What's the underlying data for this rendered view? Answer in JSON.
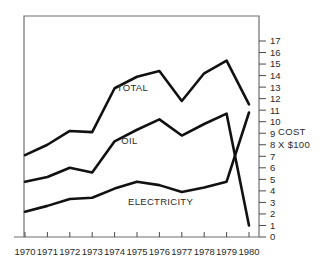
{
  "chart_data": {
    "type": "line",
    "title": "",
    "xlabel": "",
    "ylabel": "COST X $100",
    "ylim": [
      0,
      17
    ],
    "xlim": [
      1970,
      1980
    ],
    "grid": false,
    "legend_position": "inline-annotations",
    "categories": [
      "1970",
      "1971",
      "1972",
      "1973",
      "1974",
      "1975",
      "1976",
      "1977",
      "1978",
      "1979",
      "1980"
    ],
    "yticks": [
      "0",
      "1",
      "2",
      "3",
      "4",
      "5",
      "6",
      "7",
      "8",
      "9",
      "10",
      "11",
      "12",
      "13",
      "14",
      "15",
      "16",
      "17"
    ],
    "series": [
      {
        "name": "TOTAL",
        "values": [
          7.1,
          8.0,
          9.2,
          9.1,
          12.9,
          13.9,
          14.4,
          11.8,
          14.2,
          15.3,
          11.5
        ]
      },
      {
        "name": "OIL",
        "values": [
          4.8,
          5.2,
          6.0,
          5.6,
          8.3,
          9.3,
          10.2,
          8.8,
          9.8,
          10.7,
          1.0
        ]
      },
      {
        "name": "ELECTRICITY",
        "values": [
          2.2,
          2.7,
          3.3,
          3.4,
          4.2,
          4.8,
          4.5,
          3.9,
          4.3,
          4.8,
          10.8
        ]
      }
    ],
    "annotations": [
      {
        "text": "TOTAL",
        "x": 1974.1,
        "y": 13.0
      },
      {
        "text": "OIL",
        "x": 1974.3,
        "y": 8.4
      },
      {
        "text": "ELECTRICITY",
        "x": 1974.6,
        "y": 3.1
      },
      {
        "text": "COST",
        "x": 1981.3,
        "y": 9.1
      },
      {
        "text": "X $100",
        "x": 1981.3,
        "y": 8.0
      }
    ]
  },
  "axis": {
    "y_unit_line1": "COST",
    "y_unit_line2": "X $100"
  }
}
